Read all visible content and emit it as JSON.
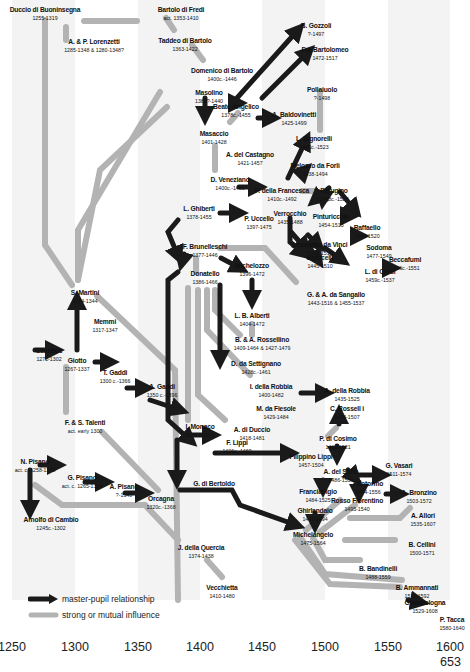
{
  "figure": {
    "page_number": "653",
    "axis": {
      "ticks": [
        {
          "label": "1250",
          "x": 12
        },
        {
          "label": "1300",
          "x": 75
        },
        {
          "label": "1350",
          "x": 138
        },
        {
          "label": "1400",
          "x": 200
        },
        {
          "label": "1450",
          "x": 262
        },
        {
          "label": "1500",
          "x": 325
        },
        {
          "label": "1550",
          "x": 388
        },
        {
          "label": "1600",
          "x": 450
        }
      ]
    },
    "legend": {
      "master_pupil": "master-pupil relationship",
      "influence": "strong or mutual influence"
    },
    "colors": {
      "master_pupil": "#1a1a1a",
      "influence": "#b3b3b3",
      "band": "#f3f3f3"
    }
  },
  "artists": [
    {
      "name": "Duccio di Buoninsegna",
      "dates": "1255-1319",
      "x": 45,
      "y": 6
    },
    {
      "name": "A. & P. Lorenzetti",
      "dates": "1285-1348 & 1280-1348?",
      "x": 94,
      "y": 38
    },
    {
      "name": "Bartolo di Fredi",
      "dates": "act. 1353-1410",
      "x": 181,
      "y": 6
    },
    {
      "name": "Taddeo di Bartolo",
      "dates": "1363-1422",
      "x": 185,
      "y": 37
    },
    {
      "name": "Domenico di Bartolo",
      "dates": "1400c.-1446",
      "x": 222,
      "y": 67
    },
    {
      "name": "Masolino",
      "dates": "1383?-1440",
      "x": 209,
      "y": 89
    },
    {
      "name": "Beato Angelico",
      "dates": "1378c.-1455",
      "x": 236,
      "y": 103
    },
    {
      "name": "A. Baldovinetti",
      "dates": "1425-1499",
      "x": 294,
      "y": 111
    },
    {
      "name": "B. Gozzoli",
      "dates": "?-1497",
      "x": 316,
      "y": 22
    },
    {
      "name": "Fra Bartolomeo",
      "dates": "1472-1517",
      "x": 325,
      "y": 46
    },
    {
      "name": "Pollaiuolo",
      "dates": "?-1498",
      "x": 322,
      "y": 86
    },
    {
      "name": "Masaccio",
      "dates": "1401-1428",
      "x": 214,
      "y": 130
    },
    {
      "name": "A. del Castagno",
      "dates": "1421-1457",
      "x": 250,
      "y": 151
    },
    {
      "name": "L. Signorelli",
      "dates": "1445c.-1523",
      "x": 314,
      "y": 135
    },
    {
      "name": "Melozzo da Forlì",
      "dates": "1438-1494",
      "x": 315,
      "y": 162
    },
    {
      "name": "D. Veneziano",
      "dates": "1400c.-1461",
      "x": 230,
      "y": 176
    },
    {
      "name": "P. della Francesca",
      "dates": "1410c.-1492",
      "x": 282,
      "y": 187
    },
    {
      "name": "Perugino",
      "dates": "1448c.-1523",
      "x": 334,
      "y": 187
    },
    {
      "name": "L. Ghiberti",
      "dates": "1378-1455",
      "x": 199,
      "y": 205
    },
    {
      "name": "P. Uccello",
      "dates": "1397-1475",
      "x": 259,
      "y": 215
    },
    {
      "name": "Verrocchio",
      "dates": "1435-1488",
      "x": 290,
      "y": 210
    },
    {
      "name": "Pinturicchio",
      "dates": "1454-1513",
      "x": 331,
      "y": 213
    },
    {
      "name": "Raffaello",
      "dates": "1483-1520",
      "x": 367,
      "y": 224
    },
    {
      "name": "F. Brunelleschi",
      "dates": "1377-1446",
      "x": 205,
      "y": 243
    },
    {
      "name": "Leonardo da Vinci",
      "dates": "1452-1519",
      "x": 320,
      "y": 241
    },
    {
      "name": "Sodoma",
      "dates": "1477-1549",
      "x": 379,
      "y": 244
    },
    {
      "name": "Michelozzo",
      "dates": "1396-1472",
      "x": 252,
      "y": 262
    },
    {
      "name": "Botticelli",
      "dates": "1445-1510",
      "x": 320,
      "y": 254
    },
    {
      "name": "Beccafumi",
      "dates": "1486c.-1551",
      "x": 405,
      "y": 256
    },
    {
      "name": "L. di Credi",
      "dates": "1459c.-1537",
      "x": 380,
      "y": 268
    },
    {
      "name": "Donatello",
      "dates": "1386-1466",
      "x": 205,
      "y": 270
    },
    {
      "name": "G. & A. da Sangallo",
      "dates": "1443-1516 & 1455-1537",
      "x": 336,
      "y": 291
    },
    {
      "name": "S. Martini",
      "dates": "1284-1344",
      "x": 85,
      "y": 289
    },
    {
      "name": "L. B. Alberti",
      "dates": "1404-1472",
      "x": 252,
      "y": 312
    },
    {
      "name": "Memmi",
      "dates": "1317-1347",
      "x": 105,
      "y": 318
    },
    {
      "name": "B. & A. Rossellino",
      "dates": "1409-1464 & 1427-1479",
      "x": 262,
      "y": 336
    },
    {
      "name": "Cimabue",
      "dates": "1272-1302",
      "x": 49,
      "y": 347
    },
    {
      "name": "Giotto",
      "dates": "1267-1337",
      "x": 77,
      "y": 357
    },
    {
      "name": "T. Gaddi",
      "dates": "1300 c.-1366",
      "x": 115,
      "y": 369
    },
    {
      "name": "D. da Settignano",
      "dates": "1428c.-1461",
      "x": 256,
      "y": 360
    },
    {
      "name": "A. Gaddi",
      "dates": "1350 c.-1396",
      "x": 162,
      "y": 383
    },
    {
      "name": "I. della Robbia",
      "dates": "1400-1482",
      "x": 271,
      "y": 383
    },
    {
      "name": "A. della Robbia",
      "dates": "1435-1525",
      "x": 347,
      "y": 387
    },
    {
      "name": "M. da Fiesole",
      "dates": "1429-1484",
      "x": 276,
      "y": 405
    },
    {
      "name": "C. Rossell i",
      "dates": "1434-1507",
      "x": 347,
      "y": 405
    },
    {
      "name": "F. & S. Talenti",
      "dates": "act. early 1300",
      "x": 85,
      "y": 419
    },
    {
      "name": "I. Monaco",
      "dates": "1370-1425 c.",
      "x": 200,
      "y": 423
    },
    {
      "name": "A. di Duccio",
      "dates": "1418-1481",
      "x": 252,
      "y": 426
    },
    {
      "name": "P. di Cosimo",
      "dates": "1461-1521",
      "x": 338,
      "y": 435
    },
    {
      "name": "F. Lippi",
      "dates": "1406c.-1469",
      "x": 237,
      "y": 439
    },
    {
      "name": "Filippino Lippi",
      "dates": "1457-1504",
      "x": 311,
      "y": 453
    },
    {
      "name": "G. Vasari",
      "dates": "1511-1574",
      "x": 399,
      "y": 462
    },
    {
      "name": "A. del Sarto",
      "dates": "1486-1530",
      "x": 341,
      "y": 468
    },
    {
      "name": "N. Pisano",
      "dates": "act. c. 1258-1278",
      "x": 35,
      "y": 458
    },
    {
      "name": "G. di Bertoldo",
      "dates": "",
      "x": 214,
      "y": 480
    },
    {
      "name": "G. Pisano",
      "dates": "act. c. 1265-1314",
      "x": 82,
      "y": 474
    },
    {
      "name": "Pontormo",
      "dates": "1494-1556",
      "x": 368,
      "y": 480
    },
    {
      "name": "A. Bronzino",
      "dates": "1503-1572",
      "x": 419,
      "y": 489
    },
    {
      "name": "Franciabigio",
      "dates": "1484-1525",
      "x": 318,
      "y": 488
    },
    {
      "name": "A. Pisano",
      "dates": "?-1348",
      "x": 124,
      "y": 483
    },
    {
      "name": "Rosso Fiorentino",
      "dates": "1495-1540",
      "x": 357,
      "y": 497
    },
    {
      "name": "Orcagna",
      "dates": "1320c.-1368",
      "x": 161,
      "y": 495
    },
    {
      "name": "Ghirlandaio",
      "dates": "1449-1494",
      "x": 315,
      "y": 507
    },
    {
      "name": "A. Allori",
      "dates": "1535-1607",
      "x": 423,
      "y": 512
    },
    {
      "name": "Arnolfo di Cambio",
      "dates": "1245c.-1302",
      "x": 51,
      "y": 516
    },
    {
      "name": "Michelangelo",
      "dates": "1475-1564",
      "x": 313,
      "y": 531
    },
    {
      "name": "B. Cellini",
      "dates": "1500-1571",
      "x": 422,
      "y": 541
    },
    {
      "name": "J. della Quercia",
      "dates": "1374-1438",
      "x": 201,
      "y": 544
    },
    {
      "name": "B. Bandinelli",
      "dates": "1488-1559",
      "x": 378,
      "y": 565
    },
    {
      "name": "B. Ammannati",
      "dates": "1511-1592",
      "x": 417,
      "y": 584
    },
    {
      "name": "Vecchietta",
      "dates": "1410-1480",
      "x": 222,
      "y": 584
    },
    {
      "name": "Giambologna",
      "dates": "1529-1608",
      "x": 425,
      "y": 599
    },
    {
      "name": "P. Tacca",
      "dates": "1580-1640",
      "x": 452,
      "y": 616
    }
  ]
}
